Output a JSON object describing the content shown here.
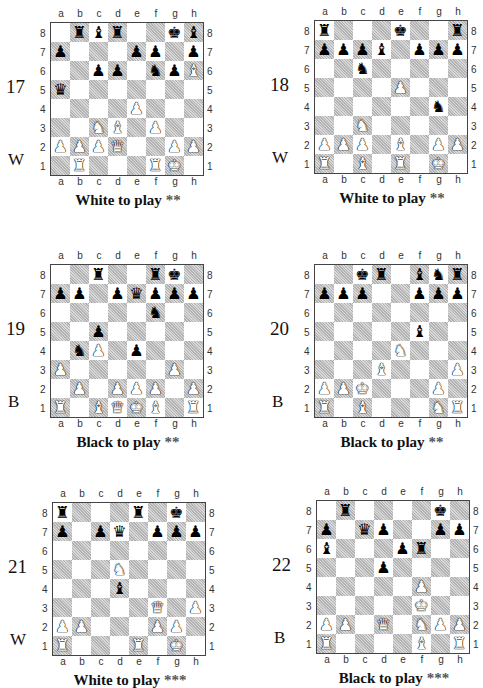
{
  "page": {
    "file_labels": [
      "a",
      "b",
      "c",
      "d",
      "e",
      "f",
      "g",
      "h"
    ],
    "rank_labels": [
      "8",
      "7",
      "6",
      "5",
      "4",
      "3",
      "2",
      "1"
    ]
  },
  "puzzles": [
    {
      "number": "17",
      "side_marker": "W",
      "caption": "White to play",
      "difficulty": "**",
      "position": [
        [
          "",
          "r",
          "b",
          "r",
          "",
          "",
          "k",
          "b"
        ],
        [
          "p",
          "",
          "",
          "",
          "p",
          "p",
          "",
          "p"
        ],
        [
          "",
          "",
          "p",
          "p",
          "",
          "n",
          "p",
          "B"
        ],
        [
          "q",
          "",
          "",
          "",
          "",
          "",
          "",
          ""
        ],
        [
          "",
          "",
          "",
          "",
          "P",
          "",
          "",
          ""
        ],
        [
          "",
          "",
          "N",
          "B",
          "",
          "P",
          "",
          ""
        ],
        [
          "P",
          "P",
          "P",
          "Q",
          "",
          "",
          "P",
          "P"
        ],
        [
          "",
          "R",
          "",
          "",
          "",
          "R",
          "K",
          ""
        ]
      ]
    },
    {
      "number": "18",
      "side_marker": "W",
      "caption": "White to play",
      "difficulty": "**",
      "position": [
        [
          "r",
          "",
          "",
          "",
          "k",
          "",
          "",
          "r"
        ],
        [
          "p",
          "p",
          "p",
          "b",
          "",
          "p",
          "p",
          "p"
        ],
        [
          "",
          "",
          "n",
          "",
          "",
          "",
          "",
          ""
        ],
        [
          "",
          "",
          "",
          "",
          "P",
          "",
          "",
          ""
        ],
        [
          "",
          "",
          "",
          "",
          "",
          "",
          "n",
          ""
        ],
        [
          "",
          "",
          "N",
          "",
          "",
          "",
          "",
          ""
        ],
        [
          "P",
          "P",
          "P",
          "",
          "B",
          "",
          "P",
          "P"
        ],
        [
          "R",
          "",
          "B",
          "",
          "R",
          "",
          "K",
          ""
        ]
      ]
    },
    {
      "number": "19",
      "side_marker": "B",
      "caption": "Black to play",
      "difficulty": "**",
      "position": [
        [
          "",
          "",
          "r",
          "",
          "",
          "r",
          "k",
          ""
        ],
        [
          "p",
          "p",
          "",
          "p",
          "q",
          "p",
          "p",
          "p"
        ],
        [
          "",
          "",
          "",
          "",
          "",
          "n",
          "",
          ""
        ],
        [
          "",
          "",
          "p",
          "",
          "",
          "",
          "",
          ""
        ],
        [
          "",
          "n",
          "P",
          "",
          "p",
          "",
          "",
          ""
        ],
        [
          "P",
          "",
          "",
          "",
          "",
          "",
          "P",
          ""
        ],
        [
          "",
          "P",
          "",
          "P",
          "P",
          "P",
          "",
          "P"
        ],
        [
          "R",
          "",
          "B",
          "Q",
          "K",
          "B",
          "",
          "R"
        ]
      ]
    },
    {
      "number": "20",
      "side_marker": "B",
      "caption": "Black to play",
      "difficulty": "**",
      "position": [
        [
          "",
          "",
          "k",
          "r",
          "",
          "b",
          "n",
          "r"
        ],
        [
          "p",
          "p",
          "p",
          "",
          "",
          "p",
          "p",
          "p"
        ],
        [
          "",
          "",
          "",
          "",
          "",
          "",
          "",
          ""
        ],
        [
          "",
          "",
          "",
          "",
          "",
          "b",
          "",
          ""
        ],
        [
          "",
          "",
          "",
          "",
          "N",
          "",
          "",
          ""
        ],
        [
          "",
          "",
          "",
          "B",
          "",
          "",
          "",
          "P"
        ],
        [
          "P",
          "P",
          "K",
          "",
          "",
          "",
          "P",
          ""
        ],
        [
          "R",
          "",
          "B",
          "",
          "",
          "",
          "N",
          "R"
        ]
      ]
    },
    {
      "number": "21",
      "side_marker": "W",
      "caption": "White to play",
      "difficulty": "***",
      "position": [
        [
          "r",
          "",
          "",
          "",
          "r",
          "",
          "k",
          ""
        ],
        [
          "p",
          "",
          "p",
          "q",
          "",
          "p",
          "p",
          "p"
        ],
        [
          "",
          "",
          "",
          "",
          "",
          "",
          "",
          ""
        ],
        [
          "",
          "",
          "",
          "N",
          "",
          "",
          "",
          ""
        ],
        [
          "",
          "",
          "",
          "b",
          "",
          "",
          "",
          ""
        ],
        [
          "",
          "",
          "",
          "",
          "",
          "Q",
          "",
          "P"
        ],
        [
          "P",
          "P",
          "",
          "",
          "",
          "P",
          "P",
          ""
        ],
        [
          "R",
          "",
          "",
          "",
          "R",
          "",
          "K",
          ""
        ]
      ]
    },
    {
      "number": "22",
      "side_marker": "B",
      "caption": "Black to play",
      "difficulty": "***",
      "position": [
        [
          "",
          "r",
          "",
          "",
          "",
          "",
          "k",
          ""
        ],
        [
          "p",
          "",
          "q",
          "p",
          "",
          "",
          "p",
          "p"
        ],
        [
          "b",
          "",
          "",
          "",
          "p",
          "r",
          "",
          ""
        ],
        [
          "",
          "",
          "",
          "p",
          "",
          "",
          "",
          ""
        ],
        [
          "",
          "",
          "",
          "",
          "",
          "P",
          "",
          ""
        ],
        [
          "",
          "",
          "",
          "",
          "",
          "K",
          "",
          ""
        ],
        [
          "P",
          "P",
          "",
          "Q",
          "",
          "N",
          "P",
          "P"
        ],
        [
          "R",
          "",
          "",
          "",
          "",
          "B",
          "",
          "R"
        ]
      ]
    }
  ]
}
